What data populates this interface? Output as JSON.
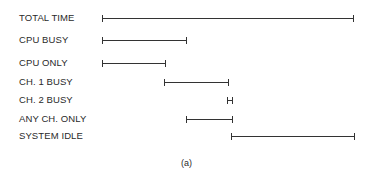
{
  "diagram": {
    "caption": "(a)",
    "rows": [
      {
        "label": "TOTAL TIME",
        "start": 103,
        "end": 353,
        "y": 18
      },
      {
        "label": "CPU BUSY",
        "start": 103,
        "end": 186,
        "y": 40
      },
      {
        "label": "CPU ONLY",
        "start": 103,
        "end": 165,
        "y": 63
      },
      {
        "label": "CH. 1 BUSY",
        "start": 165,
        "end": 228,
        "y": 82
      },
      {
        "label": "CH. 2 BUSY",
        "start": 228,
        "end": 232,
        "y": 100
      },
      {
        "label": "ANY CH. ONLY",
        "start": 187,
        "end": 232,
        "y": 119
      },
      {
        "label": "SYSTEM IDLE",
        "start": 232,
        "end": 354,
        "y": 136
      }
    ]
  }
}
